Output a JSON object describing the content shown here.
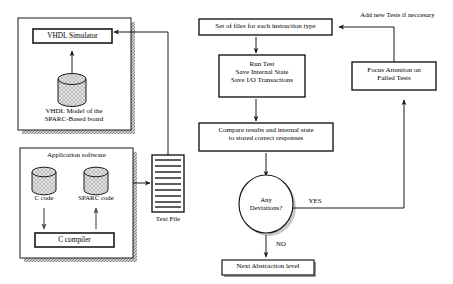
{
  "diagram": {
    "colors": {
      "line": "#1a1a1a",
      "shadow_gray": "#a8a8a8",
      "hatch_fill": "#d8d8d8",
      "background": "#ffffff"
    }
  },
  "left_panel": {
    "simulator_group": {
      "name": "VHDL simulation environment",
      "simulator_box": "VHDL Simulator",
      "model_label": "VHDL Model of the\nSPARC-Based board",
      "database_icon": "cylinder-database-icon",
      "arrow_up_icon": "arrow-up-icon"
    },
    "application_group": {
      "title": "Application software",
      "c_code_label": "C code",
      "sparc_code_label": "SPARC code",
      "compiler_box": "C compiler",
      "c_code_icon": "cylinder-database-icon",
      "sparc_code_icon": "cylinder-database-icon",
      "arrow_down_icon": "arrow-down-icon",
      "arrow_up_icon": "arrow-up-icon"
    },
    "text_file": {
      "label": "Text File",
      "icon": "text-file-lines-icon"
    }
  },
  "flow": {
    "nodes": [
      {
        "id": "set-of-files",
        "label": "Set of files for each instruction type",
        "shape": "rect"
      },
      {
        "id": "run-test",
        "label": "Run Test\nSave Internal State\nSave I/O Transactions",
        "shape": "rect"
      },
      {
        "id": "compare-results",
        "label": "Compare results and internal state\nto stored correct responses",
        "shape": "rect"
      },
      {
        "id": "any-deviations",
        "label": "Any\nDeviations?",
        "shape": "ellipse"
      },
      {
        "id": "next-abstraction",
        "label": "Next Abstraction level",
        "shape": "rect"
      },
      {
        "id": "focus-attention",
        "label": "Focus Attention on\nFailed Tests",
        "shape": "rect"
      }
    ],
    "edge_labels": {
      "yes": "YES",
      "no": "NO",
      "add_tests": "Add new Tests if neccesary"
    }
  }
}
